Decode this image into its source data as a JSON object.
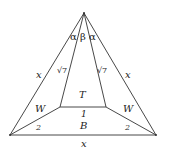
{
  "diagram": {
    "type": "geometry-figure",
    "stroke_color": "#333333",
    "points": {
      "apex": [
        84,
        13
      ],
      "base_left": [
        10,
        135
      ],
      "base_right": [
        156,
        135
      ],
      "inner_left": [
        60,
        107
      ],
      "inner_right": [
        106,
        107
      ]
    },
    "labels": {
      "alpha_left": "α",
      "beta": "β",
      "alpha_right": "α",
      "side_left_outer": "x",
      "side_right_outer": "x",
      "side_left_inner": "√7",
      "side_right_inner": "√7",
      "region_top": "T",
      "region_left": "W",
      "region_right": "W",
      "region_bottom": "B",
      "inner_base": "1",
      "lower_left": "2",
      "lower_right": "2",
      "base": "x"
    }
  }
}
